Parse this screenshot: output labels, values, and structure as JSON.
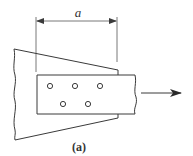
{
  "figure": {
    "label": "(a)",
    "dimension": {
      "symbol": "a"
    },
    "load_direction": "right",
    "holes": {
      "row1": [
        50,
        75,
        100
      ],
      "row2": [
        63,
        88
      ]
    },
    "colors": {
      "stroke": "#3a3a3a",
      "background": "#ffffff"
    }
  }
}
